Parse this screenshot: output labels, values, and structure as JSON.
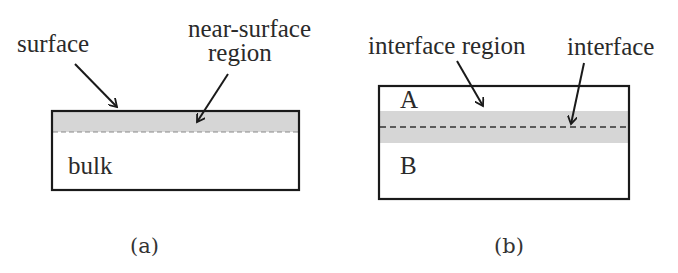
{
  "panels": {
    "a": {
      "caption": "(a)",
      "labels": {
        "surface": "surface",
        "near_surface_line1": "near-surface",
        "near_surface_line2": "region",
        "bulk": "bulk"
      }
    },
    "b": {
      "caption": "(b)",
      "labels": {
        "interface_region": "interface region",
        "interface": "interface",
        "material_a": "A",
        "material_b": "B"
      }
    }
  },
  "colors": {
    "outline": "#1a1a1a",
    "shaded_region": "#d6d6d6",
    "dashed_line_a": "#8a8a8a",
    "dashed_line_b": "#333333",
    "text": "#2a2a2a"
  }
}
